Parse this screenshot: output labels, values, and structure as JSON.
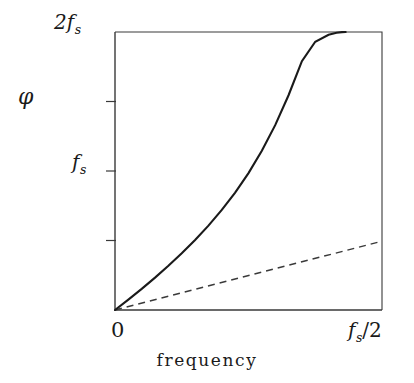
{
  "chart_data": {
    "type": "line",
    "title": "",
    "xlabel": "frequency",
    "ylabel": "φ",
    "xlim": [
      0,
      0.5
    ],
    "ylim": [
      0,
      2
    ],
    "grid": false,
    "legend": "none",
    "x_tick_labels": [
      "0",
      "f_s/2"
    ],
    "x_tick_values": [
      0,
      0.5
    ],
    "y_tick_labels": [
      "f_s",
      "2f_s"
    ],
    "y_tick_values": [
      1,
      2
    ],
    "y_minor_tick_values": [
      0.5,
      1.5
    ],
    "axis_units": "phase delay φ in units of sampling frequency f_s; frequency axis from 0 to f_s/2",
    "series": [
      {
        "name": "actual phase",
        "style": "solid",
        "x": [
          0.0,
          0.025,
          0.05,
          0.075,
          0.1,
          0.125,
          0.15,
          0.175,
          0.2,
          0.225,
          0.25,
          0.275,
          0.3,
          0.325,
          0.35,
          0.375,
          0.4,
          0.415,
          0.425,
          0.432
        ],
        "y": [
          0.0,
          0.075,
          0.152,
          0.233,
          0.318,
          0.408,
          0.504,
          0.607,
          0.72,
          0.845,
          0.985,
          1.145,
          1.33,
          1.545,
          1.79,
          1.93,
          1.98,
          1.995,
          1.999,
          2.0
        ]
      },
      {
        "name": "linear phase reference",
        "style": "dashed",
        "x": [
          0.0,
          0.5
        ],
        "y": [
          0.0,
          0.495
        ]
      }
    ]
  },
  "labels": {
    "y_axis_symbol": "φ",
    "y_top_main": "2f",
    "y_top_sub": "s",
    "y_mid_main": "f",
    "y_mid_sub": "s",
    "x_left": "0",
    "x_right_main": "f",
    "x_right_sub": "s",
    "x_right_tail": "/2",
    "x_axis_title": "frequency"
  },
  "style": {
    "axis_color": "#3a3a3a",
    "curve_color": "#1a1a1a",
    "dashed_color": "#3a3a3a",
    "background": "#ffffff"
  }
}
